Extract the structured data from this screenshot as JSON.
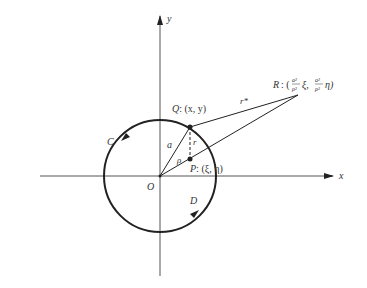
{
  "diagram": {
    "axes": {
      "x_label": "x",
      "y_label": "y",
      "origin_label": "O"
    },
    "circle": {
      "label": "C",
      "region_label": "D",
      "orientation": "counterclockwise"
    },
    "points": {
      "Q": {
        "name": "Q",
        "coords": ": (x, y)"
      },
      "P": {
        "name": "P",
        "coords": ": (ξ, η)"
      },
      "R": {
        "name": "R",
        "prefix": ": (",
        "frac_num": "a²",
        "frac_den": "ρ²",
        "xi": "ξ,",
        "eta": "η)"
      }
    },
    "segments": {
      "a": "a",
      "rho": "ρ",
      "r": "r",
      "r_star": "r*"
    },
    "colors": {
      "stroke": "#222222",
      "axis": "#444444",
      "background": "#ffffff"
    }
  }
}
